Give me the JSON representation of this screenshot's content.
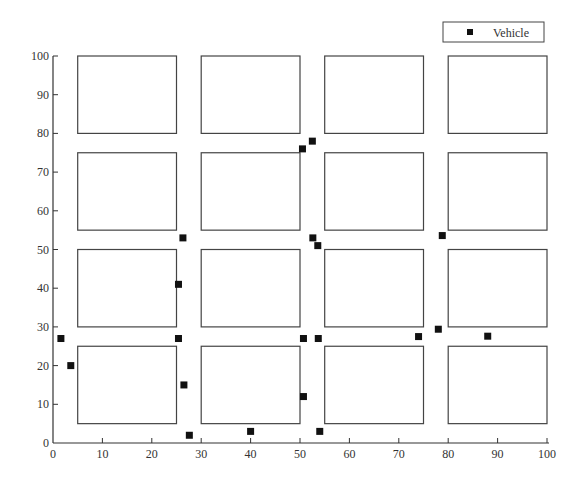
{
  "chart_data": {
    "type": "scatter",
    "title": "",
    "xlabel": "",
    "ylabel": "",
    "xlim": [
      0,
      100
    ],
    "ylim": [
      0,
      100
    ],
    "grid": false,
    "x_ticks": [
      0,
      10,
      20,
      30,
      40,
      50,
      60,
      70,
      80,
      90,
      100
    ],
    "y_ticks": [
      0,
      10,
      20,
      30,
      40,
      50,
      60,
      70,
      80,
      90,
      100
    ],
    "legend": {
      "position": "top-right",
      "entries": [
        "Vehicle"
      ]
    },
    "blocks": [
      {
        "x0": 5,
        "x1": 25,
        "y0": 80,
        "y1": 100
      },
      {
        "x0": 30,
        "x1": 50,
        "y0": 80,
        "y1": 100
      },
      {
        "x0": 55,
        "x1": 75,
        "y0": 80,
        "y1": 100
      },
      {
        "x0": 80,
        "x1": 100,
        "y0": 80,
        "y1": 100
      },
      {
        "x0": 5,
        "x1": 25,
        "y0": 55,
        "y1": 75
      },
      {
        "x0": 30,
        "x1": 50,
        "y0": 55,
        "y1": 75
      },
      {
        "x0": 55,
        "x1": 75,
        "y0": 55,
        "y1": 75
      },
      {
        "x0": 80,
        "x1": 100,
        "y0": 55,
        "y1": 75
      },
      {
        "x0": 5,
        "x1": 25,
        "y0": 30,
        "y1": 50
      },
      {
        "x0": 30,
        "x1": 50,
        "y0": 30,
        "y1": 50
      },
      {
        "x0": 55,
        "x1": 75,
        "y0": 30,
        "y1": 50
      },
      {
        "x0": 80,
        "x1": 100,
        "y0": 30,
        "y1": 50
      },
      {
        "x0": 5,
        "x1": 25,
        "y0": 5,
        "y1": 25
      },
      {
        "x0": 30,
        "x1": 50,
        "y0": 5,
        "y1": 25
      },
      {
        "x0": 55,
        "x1": 75,
        "y0": 5,
        "y1": 25
      },
      {
        "x0": 80,
        "x1": 100,
        "y0": 5,
        "y1": 25
      }
    ],
    "series": [
      {
        "name": "Vehicle",
        "marker": "square",
        "color": "#111111",
        "points": [
          {
            "x": 1.6,
            "y": 27
          },
          {
            "x": 3.6,
            "y": 20
          },
          {
            "x": 25.4,
            "y": 41
          },
          {
            "x": 26.3,
            "y": 53
          },
          {
            "x": 25.4,
            "y": 27
          },
          {
            "x": 26.5,
            "y": 15
          },
          {
            "x": 27.6,
            "y": 2
          },
          {
            "x": 40,
            "y": 3
          },
          {
            "x": 50.5,
            "y": 76
          },
          {
            "x": 52.5,
            "y": 78
          },
          {
            "x": 52.6,
            "y": 53
          },
          {
            "x": 53.6,
            "y": 51
          },
          {
            "x": 50.7,
            "y": 27
          },
          {
            "x": 53.7,
            "y": 27
          },
          {
            "x": 50.7,
            "y": 12
          },
          {
            "x": 54,
            "y": 3
          },
          {
            "x": 74,
            "y": 27.5
          },
          {
            "x": 78,
            "y": 29.4
          },
          {
            "x": 78.8,
            "y": 53.6
          },
          {
            "x": 88,
            "y": 27.6
          }
        ]
      }
    ]
  },
  "colors": {
    "axis": "#333333",
    "block_stroke": "#444444",
    "marker": "#111111",
    "background": "#ffffff"
  }
}
